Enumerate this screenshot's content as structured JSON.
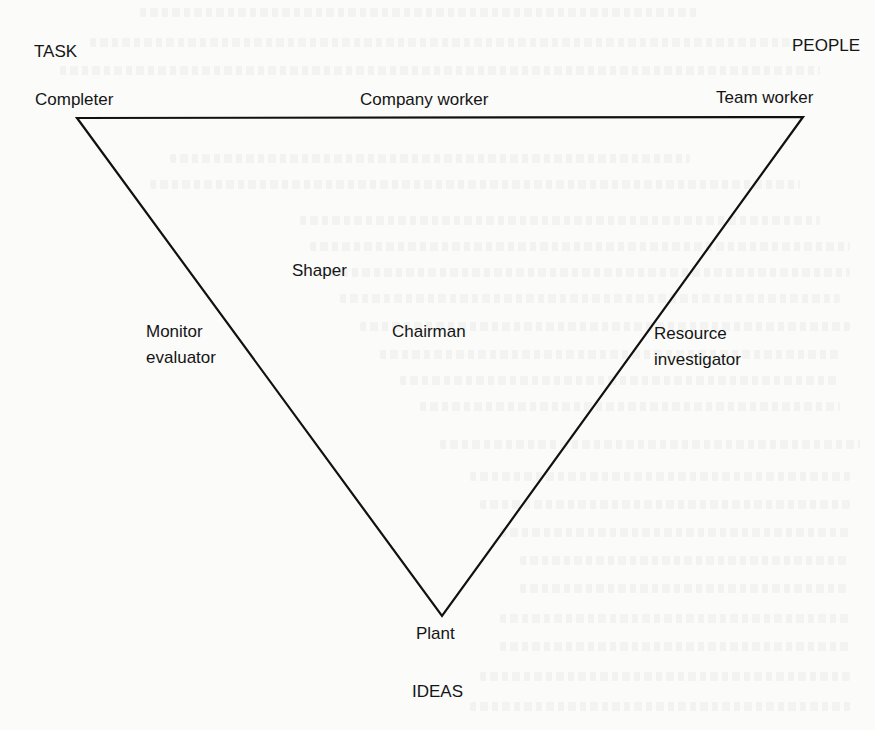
{
  "diagram": {
    "type": "inverted-triangle",
    "colors": {
      "background": "#fbfbfa",
      "line": "#111111",
      "text": "#151515"
    },
    "vertices": {
      "top_left": {
        "x": 77,
        "y": 118
      },
      "top_right": {
        "x": 803,
        "y": 117
      },
      "bottom": {
        "x": 442,
        "y": 616
      }
    },
    "corner_headings": {
      "top_left": "TASK",
      "top_right": "PEOPLE",
      "bottom": "IDEAS"
    },
    "roles": {
      "completer": "Completer",
      "company_worker": "Company worker",
      "team_worker": "Team worker",
      "shaper": "Shaper",
      "chairman": "Chairman",
      "monitor_evaluator_line1": "Monitor",
      "monitor_evaluator_line2": "evaluator",
      "resource_investigator_line1": "Resource",
      "resource_investigator_line2": "investigator",
      "plant": "Plant"
    }
  }
}
